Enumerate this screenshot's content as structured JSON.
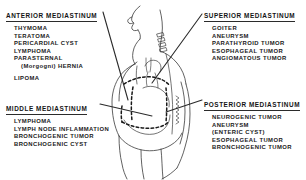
{
  "figure": {
    "view": "lateral chest silhouette",
    "line_color": "#2b2b2b",
    "background_color": "#ffffff"
  },
  "blocks": {
    "anterior": {
      "heading": "ANTERIOR  MEDIASTINUM",
      "items": [
        "THYMOMA",
        "TERATOMA",
        "PERICARDIAL  CYST",
        "LYMPHOMA",
        "PARASTERNAL",
        "(Morgogni)  HERNIA",
        "LIPOMA"
      ]
    },
    "superior": {
      "heading": "SUPERIOR  MEDIASTINUM",
      "items": [
        "GOITER",
        "ANEURYSM",
        "PARATHYROID  TUMOR",
        "ESOPHAGEAL  TUMOR",
        "ANGIOMATOUS  TUMOR"
      ]
    },
    "middle": {
      "heading": "MIDDLE  MEDIASTINUM",
      "items": [
        "LYMPHOMA",
        "LYMPH NODE INFLAMMATION",
        "BRONCHOGENIC  TUMOR",
        "BRONCHOGENIC  CYST"
      ]
    },
    "posterior": {
      "heading": "POSTERIOR  MEDIASTINUM",
      "items": [
        "NEUROGENIC  TUMOR",
        "ANEURYSM",
        "(ENTERIC  CYST)",
        "ESOPHAGEAL  TUMOR",
        "BRONCHOGENIC  TUMOR"
      ]
    }
  }
}
